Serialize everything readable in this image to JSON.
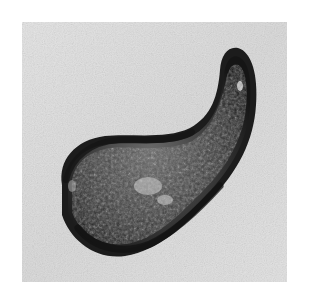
{
  "image": {
    "subject": "comma-shaped stone artifact (magatama-like)",
    "style": "grayscale photograph",
    "colors": {
      "page_background": "#ffffff",
      "photo_background": "#e2e2e2",
      "object_dark": "#1e1e1e",
      "object_mid": "#4a4a4a",
      "highlight": "#d8d8d8"
    }
  }
}
